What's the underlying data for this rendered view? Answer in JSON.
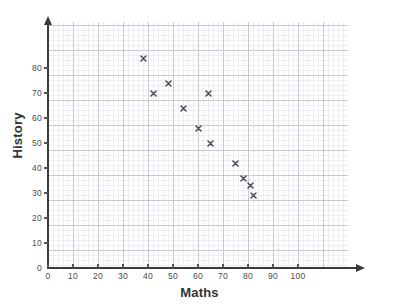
{
  "chart_data": {
    "type": "scatter",
    "title": "",
    "xlabel": "Maths",
    "ylabel": "History",
    "xlim": [
      0,
      120
    ],
    "ylim": [
      0,
      86
    ],
    "xticks": [
      0,
      10,
      20,
      30,
      40,
      50,
      60,
      70,
      80,
      90,
      100
    ],
    "yticks": [
      0,
      10,
      20,
      30,
      40,
      50,
      60,
      70,
      80
    ],
    "grid": true,
    "grid_minor": true,
    "legend": "none",
    "marker": "x",
    "marker_color": "#4a4a52",
    "points": [
      {
        "x": 38,
        "y": 84
      },
      {
        "x": 42,
        "y": 70
      },
      {
        "x": 48,
        "y": 74
      },
      {
        "x": 54,
        "y": 64
      },
      {
        "x": 60,
        "y": 56
      },
      {
        "x": 64,
        "y": 70
      },
      {
        "x": 65,
        "y": 50
      },
      {
        "x": 75,
        "y": 42
      },
      {
        "x": 78,
        "y": 36
      },
      {
        "x": 81,
        "y": 33
      },
      {
        "x": 82,
        "y": 29
      }
    ],
    "x": [
      38,
      42,
      48,
      54,
      60,
      64,
      65,
      75,
      78,
      81,
      82
    ],
    "values": [
      84,
      70,
      74,
      64,
      56,
      70,
      50,
      42,
      36,
      33,
      29
    ]
  },
  "colors": {
    "axis": "#3a3a3a",
    "grid_major": "#c9c9d6",
    "grid_minor": "#ededf3",
    "text": "#333333",
    "marker": "#4a4a52",
    "background": "#ffffff"
  }
}
